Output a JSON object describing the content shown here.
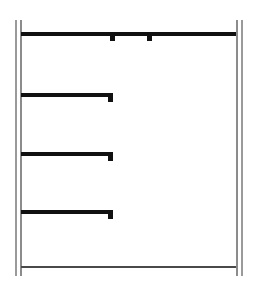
{
  "drawing": {
    "title": "Shelving Unit Elevation",
    "type": "technical-line-drawing",
    "width": 254,
    "height": 284,
    "background_color": "#ffffff",
    "colors": {
      "post": "#9a9a9a",
      "post_inner": "#8c8c8c",
      "rail": "#111111",
      "bottom_rail": "#4a4a4a"
    },
    "posts": [
      {
        "name": "left-outer-post",
        "x": 15,
        "y": 20,
        "width": 2,
        "height": 256,
        "color": "#9a9a9a"
      },
      {
        "name": "left-inner-post",
        "x": 20,
        "y": 20,
        "width": 2,
        "height": 256,
        "color": "#8c8c8c"
      },
      {
        "name": "right-outer-post",
        "x": 236,
        "y": 20,
        "width": 2,
        "height": 256,
        "color": "#8c8c8c"
      },
      {
        "name": "right-inner-post",
        "x": 241,
        "y": 20,
        "width": 2,
        "height": 256,
        "color": "#9a9a9a"
      }
    ],
    "rails": [
      {
        "name": "top-rail",
        "label": "Top Rail",
        "x": 21,
        "y": 32,
        "width": 215,
        "height": 4,
        "color": "#111111",
        "tabs": [
          {
            "name": "top-rail-tab-left",
            "x": 110,
            "y": 36,
            "width": 5,
            "height": 5
          },
          {
            "name": "top-rail-tab-right",
            "x": 147,
            "y": 36,
            "width": 5,
            "height": 5
          }
        ]
      },
      {
        "name": "shelf-rail-1",
        "label": "Shelf 1",
        "x": 21,
        "y": 93,
        "width": 92,
        "height": 4,
        "color": "#111111",
        "tabs": [
          {
            "name": "shelf-rail-1-end-tab",
            "x": 108,
            "y": 97,
            "width": 5,
            "height": 5
          }
        ]
      },
      {
        "name": "shelf-rail-2",
        "label": "Shelf 2",
        "x": 21,
        "y": 152,
        "width": 92,
        "height": 4,
        "color": "#111111",
        "tabs": [
          {
            "name": "shelf-rail-2-end-tab",
            "x": 108,
            "y": 156,
            "width": 5,
            "height": 5
          }
        ]
      },
      {
        "name": "shelf-rail-3",
        "label": "Shelf 3",
        "x": 21,
        "y": 210,
        "width": 92,
        "height": 4,
        "color": "#111111",
        "tabs": [
          {
            "name": "shelf-rail-3-end-tab",
            "x": 108,
            "y": 214,
            "width": 5,
            "height": 5
          }
        ]
      },
      {
        "name": "bottom-rail",
        "label": "Bottom Rail",
        "x": 21,
        "y": 266,
        "width": 215,
        "height": 2,
        "color": "#4a4a4a",
        "tabs": []
      }
    ]
  }
}
